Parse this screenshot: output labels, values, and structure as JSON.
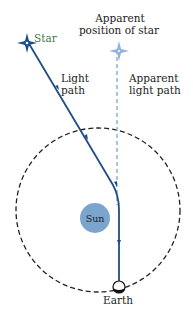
{
  "diagram": {
    "labels": {
      "star": "Star",
      "light_path_1": "Light",
      "light_path_2": "path",
      "apparent_position_1": "Apparent",
      "apparent_position_2": "position of star",
      "apparent_light_path_1": "Apparent",
      "apparent_light_path_2": "light path",
      "sun": "Sun",
      "earth": "Earth"
    },
    "colors": {
      "light_path": "#1f4f86",
      "apparent_path": "#8fb3d9",
      "sun_fill": "#7ba4cf",
      "orbit": "#222222",
      "star_label": "#3f7a4a",
      "text": "#222222"
    }
  }
}
